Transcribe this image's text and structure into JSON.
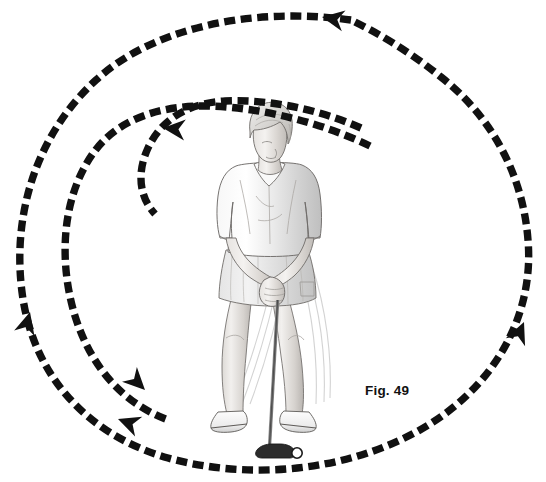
{
  "figure": {
    "caption": "Fig. 49",
    "caption_x": 365,
    "caption_y": 396,
    "background_color": "#ffffff",
    "ink_color": "#111111",
    "width": 546,
    "height": 482
  },
  "chart_data": {
    "type": "diagram",
    "title": "Fig. 49",
    "grid": false,
    "legend": false,
    "annotations": [
      {
        "name": "figure-label",
        "text": "Fig. 49",
        "x": 365,
        "y": 396
      }
    ],
    "paths": [
      {
        "name": "outer-arc",
        "label": "outer dashed swing arc",
        "direction": "counter-clockwise",
        "stroke": "#111111",
        "stroke_width": 7.4,
        "dash": [
          11,
          5.6
        ],
        "d": "M 351 20 C 247 6 150 30 96 80 C 36 135 12 215 22 292 C 32 372 84 434 168 458 C 255 482 356 470 430 424 C 500 380 534 310 528 240 C 523 175 492 117 441 77 C 410 52 380 34 351 20 Z",
        "arrows": [
          {
            "name": "outer-arc-arrow-top",
            "x": 322,
            "y": 17,
            "angle": 190
          },
          {
            "name": "outer-arc-arrow-right",
            "x": 524,
            "y": 322,
            "angle": 293
          },
          {
            "name": "outer-arc-arrow-bottom-left",
            "x": 118,
            "y": 419,
            "angle": 200
          }
        ]
      },
      {
        "name": "middle-arc",
        "label": "middle dashed swing arc",
        "direction": "counter-clockwise",
        "stroke": "#111111",
        "stroke_width": 7.4,
        "dash": [
          11,
          5.6
        ],
        "d": "M 370 146 C 320 122 262 108 210 106 C 160 105 118 119 94 152 C 62 196 58 260 75 316 C 92 370 125 404 168 420",
        "arrows": [
          {
            "name": "middle-arc-arrow-left",
            "x": 30,
            "y": 312,
            "angle": 285
          },
          {
            "name": "middle-arc-arrow-lower",
            "x": 145,
            "y": 390,
            "angle": 45
          }
        ]
      },
      {
        "name": "inner-arc",
        "label": "inner dashed swing arc",
        "direction": "counter-clockwise",
        "stroke": "#111111",
        "stroke_width": 7.4,
        "dash": [
          11,
          5.6
        ],
        "d": "M 361 128 C 318 109 268 99 225 101 C 190 103 162 118 148 148 C 136 174 140 198 155 214",
        "arrows": [
          {
            "name": "inner-arc-arrow-left",
            "x": 163,
            "y": 128,
            "angle": 185
          }
        ]
      }
    ],
    "figure_elements": [
      {
        "name": "golfer",
        "label": "female golfer illustration",
        "x": 196,
        "y": 122,
        "width": 148,
        "height": 310
      },
      {
        "name": "golf-club",
        "label": "putter shaft and head",
        "x": 272,
        "y": 270,
        "width": 46,
        "height": 185
      },
      {
        "name": "golf-ball",
        "label": "golf ball",
        "x": 296,
        "y": 450,
        "r": 5
      }
    ]
  }
}
